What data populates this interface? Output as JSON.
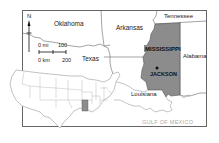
{
  "map": {
    "highlight_state": "MISSISSIPPI",
    "capital": "JACKSON",
    "labels": {
      "oklahoma": "Oklahoma",
      "arkansas": "Arkansas",
      "tennessee": "Tennessee",
      "texas": "Texas",
      "alabama": "Alabama",
      "louisiana": "Louisiana",
      "gulf": "GULF OF MEXICO"
    },
    "north_arrow": "N",
    "scale": {
      "mi_start": "0 mi",
      "mi_end": "100",
      "km_start": "0 km",
      "km_end": "200"
    },
    "colors": {
      "highlight": "#8c8c8c",
      "border": "#555555",
      "frame": "#666666",
      "inset_border": "#999999",
      "gulf_text": "#aaaaaa"
    }
  }
}
